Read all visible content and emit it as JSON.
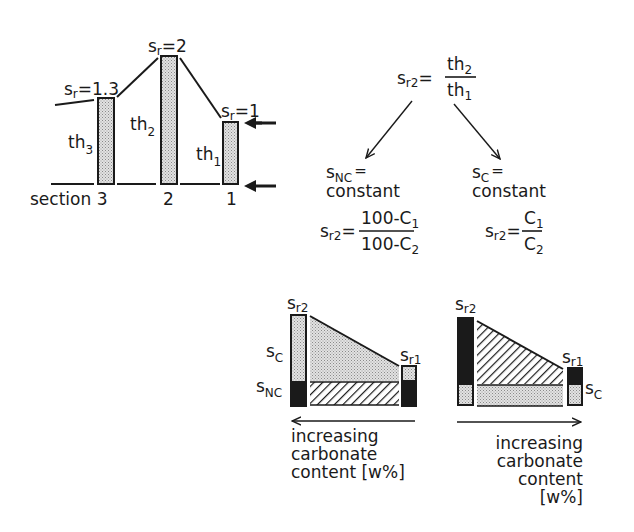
{
  "colors": {
    "ink": "#1a1a1a",
    "stipple_bg": "#d9d9d9",
    "background": "#ffffff"
  },
  "section_diagram": {
    "sections": [
      {
        "id": "3",
        "label": "section 3",
        "thickness_label": "th",
        "thickness_sub": "3",
        "sr_label": "s",
        "sr_sub": "r",
        "sr_value": "=1.3"
      },
      {
        "id": "2",
        "label": "2",
        "thickness_label": "th",
        "thickness_sub": "2",
        "sr_label": "s",
        "sr_sub": "r",
        "sr_value": "=2"
      },
      {
        "id": "1",
        "label": "1",
        "thickness_label": "th",
        "thickness_sub": "1",
        "sr_label": "s",
        "sr_sub": "r",
        "sr_value": "=1"
      }
    ],
    "arrows": [
      "top-marker-arrow",
      "bottom-marker-arrow"
    ]
  },
  "formula_tree": {
    "root": {
      "lhs": "s",
      "lhs_sub": "r2",
      "eq": "=",
      "num": "th",
      "num_sub": "2",
      "den": "th",
      "den_sub": "1"
    },
    "left": {
      "condition_var": "s",
      "condition_sub": "NC",
      "condition_eq": "=",
      "condition_text": "constant",
      "lhs": "s",
      "lhs_sub": "r2",
      "eq": "=",
      "num": "100-C",
      "num_sub": "1",
      "den": "100-C",
      "den_sub": "2"
    },
    "right": {
      "condition_var": "s",
      "condition_sub": "C",
      "condition_eq": "=",
      "condition_text": "constant",
      "lhs": "s",
      "lhs_sub": "r2",
      "eq": "=",
      "num": "C",
      "num_sub": "1",
      "den": "C",
      "den_sub": "2"
    }
  },
  "bottom_left": {
    "label_sr2": "s",
    "label_sr2_sub": "r2",
    "label_sr1": "s",
    "label_sr1_sub": "r1",
    "label_sc": "s",
    "label_sc_sub": "C",
    "label_snc": "s",
    "label_snc_sub": "NC",
    "caption": [
      "increasing",
      "carbonate",
      "content [w%]"
    ],
    "arrow_direction": "left"
  },
  "bottom_right": {
    "label_sr2": "s",
    "label_sr2_sub": "r2",
    "label_sr1": "s",
    "label_sr1_sub": "r1",
    "label_sc": "s",
    "label_sc_sub": "C",
    "caption": [
      "increasing",
      "carbonate",
      "content",
      "[w%]"
    ],
    "arrow_direction": "right"
  }
}
